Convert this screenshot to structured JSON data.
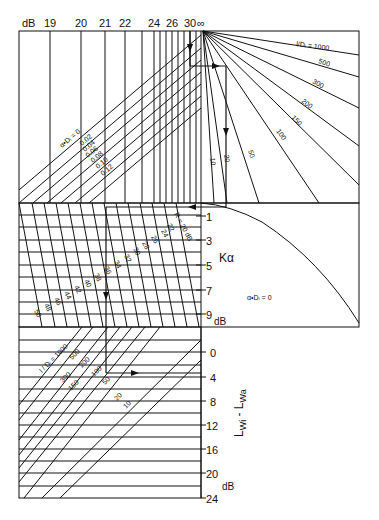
{
  "figure": {
    "type": "nomogram",
    "ink_color": "#111111",
    "background": "#ffffff"
  },
  "top_axis": {
    "unit": "dB",
    "ticks": [
      {
        "label": "19",
        "x": 50
      },
      {
        "label": "20",
        "x": 81
      },
      {
        "label": "21",
        "x": 105
      },
      {
        "label": "22",
        "x": 125
      },
      {
        "label": "24",
        "x": 154
      },
      {
        "label": "26",
        "x": 172
      },
      {
        "label": "30",
        "x": 190
      },
      {
        "label": "∞",
        "x": 203
      }
    ],
    "extra_lines_x": [
      142,
      160,
      166,
      178,
      184,
      196
    ]
  },
  "top_left_panel": {
    "label_alpha": "α•Dᵢ = 0",
    "alpha_values": [
      "0.02",
      "0.04",
      "0.06",
      "0.08",
      "0.10",
      "0.12"
    ]
  },
  "top_right_panel": {
    "fan_title": "l/Dᵢ = 1000",
    "fan_labels": [
      "500",
      "300",
      "200",
      "150",
      "100",
      "50",
      "20",
      "10"
    ]
  },
  "middle_left_panel": {
    "r_title": "R = 20 dB",
    "r_values": [
      "22",
      "24",
      "26",
      "28",
      "30",
      "32",
      "34",
      "36",
      "38",
      "40",
      "42",
      "44",
      "46",
      "48",
      "50"
    ]
  },
  "k_alpha_axis": {
    "symbol": "Kα",
    "unit": "dB",
    "ticks": [
      "1",
      "3",
      "5",
      "7",
      "9"
    ]
  },
  "middle_right_panel": {
    "curve_label": "α•Dᵢ = 0"
  },
  "bottom_panel": {
    "fan_title": "l / Dᵢ = 1000",
    "labels": [
      "500",
      "300",
      "200",
      "150",
      "100",
      "50",
      "20",
      "10"
    ]
  },
  "bottom_axis": {
    "symbol": "L",
    "sub1": "Wi",
    "dash": " - L",
    "sub2": "Wa",
    "unit": "dB",
    "ticks": [
      "0",
      "4",
      "8",
      "12",
      "16",
      "20",
      "24"
    ]
  }
}
